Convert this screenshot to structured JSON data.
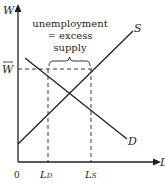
{
  "diagram": {
    "axes": {
      "y_label": "W",
      "x_label": "L",
      "origin_label": "0"
    },
    "wage_label": "W",
    "wage_bar": true,
    "curves": {
      "supply_label": "S",
      "demand_label": "D"
    },
    "quantities": {
      "ld_main": "L",
      "ld_sub": "D",
      "ls_main": "L",
      "ls_sub": "S"
    },
    "annotation": {
      "line1": "unemployment",
      "line2": "= excess",
      "line3": "supply"
    },
    "colors": {
      "line": "#231f20",
      "dashed": "#231f20",
      "background": "#ffffff"
    }
  }
}
